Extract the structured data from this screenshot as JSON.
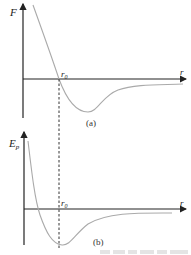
{
  "figure": {
    "panel_a": {
      "y_label": "F",
      "x_label": "r",
      "marker_label": "r",
      "marker_sub": "0",
      "caption": "(a)"
    },
    "panel_b": {
      "y_label": "E",
      "y_sub": "p",
      "x_label": "r",
      "marker_label": "r",
      "marker_sub": "0",
      "caption": "(b)"
    },
    "colors": {
      "axis": "#222222",
      "curve": "#aaaaaa",
      "dashed": "#333333"
    }
  }
}
